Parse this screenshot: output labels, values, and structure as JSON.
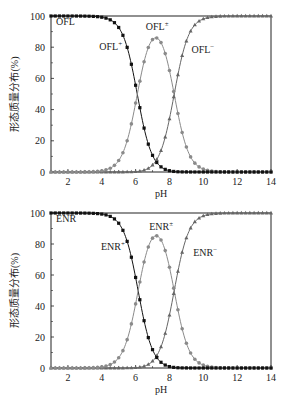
{
  "chart_data": [
    {
      "type": "line",
      "panel": "top",
      "compound": "OFL",
      "title": "",
      "panel_label": "OFL",
      "xlabel": "pH",
      "ylabel": "形态质量分布(%)",
      "xlim": [
        1,
        14
      ],
      "ylim": [
        0,
        100
      ],
      "xticks": [
        2,
        4,
        6,
        8,
        10,
        12,
        14
      ],
      "yticks": [
        0,
        20,
        40,
        60,
        80,
        100
      ],
      "grid": false,
      "legend": "none (inline annotations)",
      "pKa1": 6.1,
      "pKa2": 8.28,
      "x_step": 0.25,
      "series": [
        {
          "name": "OFL+",
          "label": "OFL",
          "sup": "+",
          "marker": "square",
          "color": "#111111",
          "x": [
            1,
            2,
            3,
            4,
            5,
            5.5,
            6,
            6.5,
            7,
            7.5,
            8,
            8.5,
            9,
            10,
            11,
            12,
            13,
            14
          ],
          "values": [
            100,
            99.9,
            99.9,
            99.2,
            92.7,
            80.1,
            55.6,
            27.5,
            10.8,
            3.4,
            1.0,
            0.3,
            0.1,
            0,
            0,
            0,
            0,
            0
          ]
        },
        {
          "name": "OFL±",
          "label": "OFL",
          "sup": "±",
          "marker": "circle",
          "color": "#808080",
          "x": [
            1,
            2,
            3,
            4,
            5,
            5.5,
            6,
            6.5,
            7,
            7.25,
            7.5,
            8,
            8.5,
            9,
            10,
            11,
            12,
            13,
            14
          ],
          "values": [
            0,
            0,
            0.1,
            0.8,
            7.3,
            19.9,
            44.2,
            70.5,
            82.9,
            85.8,
            82.9,
            65.8,
            37.4,
            16.0,
            1.9,
            0.2,
            0,
            0,
            0
          ]
        },
        {
          "name": "OFL-",
          "label": "OFL",
          "sup": "−",
          "marker": "triangle",
          "color": "#555555",
          "x": [
            1,
            2,
            3,
            4,
            5,
            5.5,
            6,
            6.5,
            7,
            7.5,
            8,
            8.5,
            9,
            10,
            11,
            12,
            13,
            14
          ],
          "values": [
            0,
            0,
            0,
            0,
            0,
            0,
            0.2,
            2.0,
            6.3,
            13.7,
            33.2,
            62.3,
            83.9,
            98.1,
            99.8,
            100,
            100,
            100
          ]
        }
      ],
      "annotations": [
        {
          "text": "OFL",
          "sup": "",
          "x": 1.3,
          "y": 94
        },
        {
          "text": "OFL",
          "sup": "+",
          "x": 3.85,
          "y": 78
        },
        {
          "text": "OFL",
          "sup": "±",
          "x": 6.6,
          "y": 91
        },
        {
          "text": "OFL",
          "sup": "−",
          "x": 9.3,
          "y": 76
        }
      ]
    },
    {
      "type": "line",
      "panel": "bottom",
      "compound": "ENR",
      "title": "",
      "panel_label": "ENR",
      "xlabel": "pH",
      "ylabel": "形态质量分布(%)",
      "xlim": [
        1,
        14
      ],
      "ylim": [
        0,
        100
      ],
      "xticks": [
        2,
        4,
        6,
        8,
        10,
        12,
        14
      ],
      "yticks": [
        0,
        20,
        40,
        60,
        80,
        100
      ],
      "grid": false,
      "legend": "none (inline annotations)",
      "pKa1": 6.15,
      "pKa2": 8.28,
      "x_step": 0.25,
      "series": [
        {
          "name": "ENR+",
          "label": "ENR",
          "sup": "+",
          "marker": "square",
          "color": "#111111",
          "x": [
            1,
            2,
            3,
            4,
            5,
            5.5,
            6,
            6.5,
            7,
            7.5,
            8,
            8.5,
            9,
            10,
            11,
            12,
            13,
            14
          ],
          "values": [
            100,
            99.9,
            99.9,
            99.3,
            93.4,
            81.7,
            58.5,
            30.7,
            12.3,
            4.0,
            1.3,
            0.4,
            0.1,
            0,
            0,
            0,
            0,
            0
          ]
        },
        {
          "name": "ENR±",
          "label": "ENR",
          "sup": "±",
          "marker": "circle",
          "color": "#808080",
          "x": [
            1,
            2,
            3,
            4,
            5,
            5.5,
            6,
            6.5,
            7,
            7.25,
            7.5,
            8,
            8.5,
            9,
            10,
            11,
            12,
            13,
            14
          ],
          "values": [
            0,
            0,
            0.1,
            0.7,
            6.6,
            18.3,
            41.3,
            67.4,
            81.4,
            84.0,
            82.2,
            65.3,
            37.2,
            15.8,
            1.8,
            0.2,
            0,
            0,
            0
          ]
        },
        {
          "name": "ENR-",
          "label": "ENR",
          "sup": "−",
          "marker": "triangle",
          "color": "#555555",
          "x": [
            1,
            2,
            3,
            4,
            5,
            5.5,
            6,
            6.5,
            7,
            7.5,
            8,
            8.5,
            9,
            10,
            11,
            12,
            13,
            14
          ],
          "values": [
            0,
            0,
            0,
            0,
            0,
            0,
            0.2,
            1.9,
            6.3,
            13.8,
            33.4,
            62.4,
            84.1,
            98.2,
            99.8,
            100,
            100,
            100
          ]
        }
      ],
      "annotations": [
        {
          "text": "ENR",
          "sup": "",
          "x": 1.3,
          "y": 94
        },
        {
          "text": "ENR",
          "sup": "+",
          "x": 3.95,
          "y": 76
        },
        {
          "text": "ENR",
          "sup": "±",
          "x": 6.8,
          "y": 89
        },
        {
          "text": "ENR",
          "sup": "−",
          "x": 9.4,
          "y": 72
        }
      ]
    }
  ],
  "layout": {
    "panels": [
      {
        "left": 51,
        "right": 271,
        "top": 16,
        "bottom": 172
      },
      {
        "left": 51,
        "right": 271,
        "top": 213,
        "bottom": 368
      }
    ],
    "colors": {
      "cation": "#111111",
      "zwitterion": "#8a8a8a",
      "anion": "#666666",
      "axis": "#222222"
    }
  }
}
